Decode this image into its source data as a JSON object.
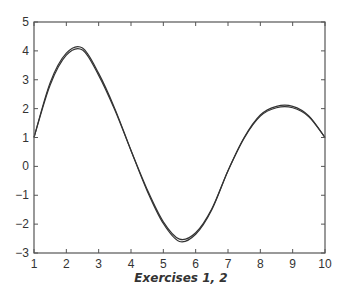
{
  "caption": "Exercises 1, 2",
  "chart_data": {
    "type": "line",
    "title": "",
    "xlabel": "",
    "ylabel": "",
    "xlim": [
      1,
      10
    ],
    "ylim": [
      -3,
      5
    ],
    "xticks": [
      1,
      2,
      3,
      4,
      5,
      6,
      7,
      8,
      9,
      10
    ],
    "yticks": [
      -3,
      -2,
      -1,
      0,
      1,
      2,
      3,
      4,
      5
    ],
    "grid": false,
    "legend": null,
    "x": [
      1,
      1.5,
      2,
      2.5,
      3,
      3.5,
      4,
      4.5,
      5,
      5.5,
      6,
      6.5,
      7,
      7.5,
      8,
      8.5,
      9,
      9.5,
      10
    ],
    "series": [
      {
        "name": "curve 1",
        "color": "#333333",
        "values": [
          1.0,
          2.9,
          3.92,
          4.1,
          3.22,
          2.0,
          0.55,
          -0.85,
          -1.98,
          -2.6,
          -2.35,
          -1.5,
          -0.15,
          1.0,
          1.78,
          2.08,
          2.08,
          1.75,
          1.0
        ]
      },
      {
        "name": "curve 2",
        "color": "#333333",
        "values": [
          1.0,
          2.82,
          3.85,
          4.03,
          3.15,
          1.95,
          0.55,
          -0.8,
          -1.92,
          -2.52,
          -2.3,
          -1.47,
          -0.15,
          0.98,
          1.74,
          2.03,
          2.03,
          1.72,
          1.0
        ]
      }
    ]
  }
}
